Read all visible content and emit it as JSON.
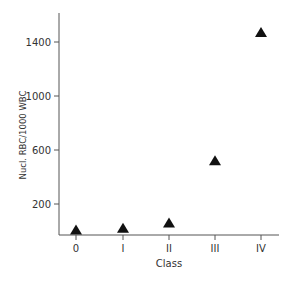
{
  "chart_data": {
    "type": "scatter",
    "title": "",
    "xlabel": "Class",
    "ylabel": "Nucl. RBC/1000 WBC",
    "categories": [
      "0",
      "I",
      "II",
      "III",
      "IV"
    ],
    "series": [
      {
        "name": "Nucl. RBC/1000 WBC",
        "marker": "triangle",
        "color": "#111111",
        "values": [
          5,
          20,
          60,
          520,
          1470
        ]
      }
    ],
    "yticks": [
      200,
      600,
      1000,
      1400
    ],
    "ylim": [
      -50,
      1600
    ],
    "grid": false,
    "legend": null
  }
}
